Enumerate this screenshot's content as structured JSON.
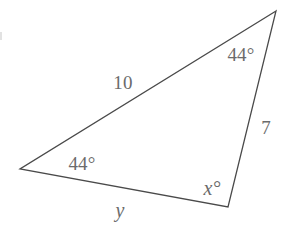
{
  "figure": {
    "kind": "triangle-diagram",
    "background_color": "#ffffff",
    "stroke_color": "#4a4a4a",
    "label_color": "#6b6b6b",
    "stroke_width": 1.3,
    "vertices": {
      "apex": {
        "name": "top-vertex",
        "x": 276,
        "y": 11
      },
      "left": {
        "name": "left-vertex",
        "x": 20,
        "y": 169
      },
      "bottom_right": {
        "name": "bottom-right-vertex",
        "x": 228,
        "y": 207
      }
    },
    "labels": {
      "top_angle": {
        "text": "44°",
        "x": 241,
        "y": 54
      },
      "left_angle": {
        "text": "44°",
        "x": 82,
        "y": 163
      },
      "bottom_right_angle": {
        "text": "x°",
        "x": 212,
        "y": 188
      },
      "left_side": {
        "text": "10",
        "x": 123,
        "y": 82
      },
      "right_side": {
        "text": "7",
        "x": 266,
        "y": 127
      },
      "bottom_side": {
        "text": "y",
        "x": 120,
        "y": 210
      }
    }
  },
  "chart_data": {
    "type": "diagram",
    "title": "",
    "shape": "triangle",
    "points": [
      {
        "id": "A",
        "role": "top-vertex",
        "x": 276,
        "y": 11
      },
      {
        "id": "B",
        "role": "left-vertex",
        "x": 20,
        "y": 169
      },
      {
        "id": "C",
        "role": "bottom-right-vertex",
        "x": 228,
        "y": 207
      }
    ],
    "edges": [
      {
        "from": "A",
        "to": "B",
        "label": "10"
      },
      {
        "from": "A",
        "to": "C",
        "label": "7"
      },
      {
        "from": "B",
        "to": "C",
        "label": "y"
      }
    ],
    "angles": [
      {
        "at": "A",
        "label": "44°",
        "value": 44,
        "known": true
      },
      {
        "at": "B",
        "label": "44°",
        "value": 44,
        "known": true
      },
      {
        "at": "C",
        "label": "x°",
        "value": null,
        "known": false
      }
    ],
    "known_values": {
      "side_10": 10,
      "side_7": 7,
      "angle_top": 44,
      "angle_left": 44
    },
    "unknowns": [
      "x",
      "y"
    ]
  }
}
